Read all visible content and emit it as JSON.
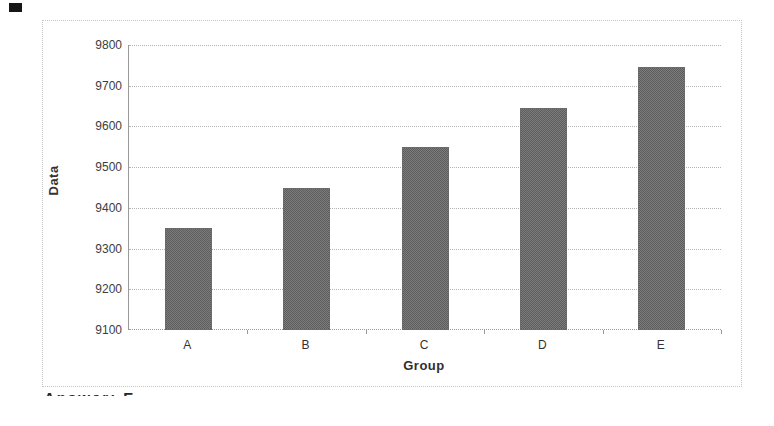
{
  "chart_data": {
    "type": "bar",
    "categories": [
      "A",
      "B",
      "C",
      "D",
      "E"
    ],
    "values": [
      9350,
      9450,
      9550,
      9645,
      9745
    ],
    "title": "",
    "xlabel": "Group",
    "ylabel": "Data",
    "ylim": [
      9100,
      9800
    ],
    "ytick_step": 100,
    "ytick_labels": [
      "9100",
      "9200",
      "9300",
      "9400",
      "9500",
      "9600",
      "9700",
      "9800"
    ],
    "grid": true,
    "gridline_style": "dotted",
    "legend": false,
    "bar_color": "#6b6b6b",
    "gridline_color": "#b3b3b3",
    "axis_color": "#9a9a9a"
  },
  "footer": {
    "answer_text": "Answer: E"
  }
}
